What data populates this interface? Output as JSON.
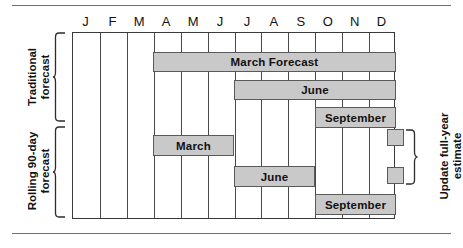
{
  "chart_data": {
    "type": "bar",
    "xlabel": "",
    "ylabel": "",
    "grid": true,
    "legend_position": "none",
    "categories": [
      "J",
      "F",
      "M",
      "A",
      "M",
      "J",
      "J",
      "A",
      "S",
      "O",
      "N",
      "D"
    ],
    "x_axis_months": [
      "J",
      "F",
      "M",
      "A",
      "M",
      "J",
      "J",
      "A",
      "S",
      "O",
      "N",
      "D"
    ],
    "xlim": [
      1,
      13
    ],
    "groups": [
      {
        "name": "Traditional forecast",
        "bars": [
          {
            "label": "March Forecast",
            "start_month": 4,
            "end_month": 13,
            "row": 0
          },
          {
            "label": "June",
            "start_month": 7,
            "end_month": 13,
            "row": 1
          },
          {
            "label": "September",
            "start_month": 10,
            "end_month": 13,
            "row": 2
          }
        ]
      },
      {
        "name": "Rolling 90-day forecast",
        "bars": [
          {
            "label": "March",
            "start_month": 4,
            "end_month": 7,
            "row": 3
          },
          {
            "label": "June",
            "start_month": 7,
            "end_month": 10,
            "row": 4
          },
          {
            "label": "September",
            "start_month": 10,
            "end_month": 13,
            "row": 5
          }
        ]
      }
    ],
    "annotations": [
      {
        "label": "Update full-year estimate",
        "markers": 2,
        "at_month": 12.6
      }
    ]
  },
  "months": [
    {
      "label": "J"
    },
    {
      "label": "F"
    },
    {
      "label": "M"
    },
    {
      "label": "A"
    },
    {
      "label": "M"
    },
    {
      "label": "J"
    },
    {
      "label": "J"
    },
    {
      "label": "A"
    },
    {
      "label": "S"
    },
    {
      "label": "O"
    },
    {
      "label": "N"
    },
    {
      "label": "D"
    }
  ],
  "bars": [
    {
      "label": "March Forecast",
      "left": 80,
      "top": 19,
      "width": 243,
      "height": 20
    },
    {
      "label": "June",
      "left": 161,
      "top": 47,
      "width": 162,
      "height": 20
    },
    {
      "label": "September",
      "left": 242,
      "top": 74,
      "width": 81,
      "height": 21
    },
    {
      "label": "March",
      "left": 80,
      "top": 102,
      "width": 81,
      "height": 21
    },
    {
      "label": "June",
      "left": 161,
      "top": 133,
      "width": 81,
      "height": 21
    },
    {
      "label": "September",
      "left": 242,
      "top": 161,
      "width": 81,
      "height": 21
    }
  ],
  "side_labels": {
    "traditional": "Traditional\nforecast",
    "traditional_line1": "Traditional",
    "traditional_line2": "forecast",
    "rolling_line1": "Rolling 90-day",
    "rolling_line2": "forecast"
  },
  "right_label": {
    "line1": "Update full-year",
    "line2": "estimate"
  },
  "colors": {
    "bar_fill": "#c9c9c9",
    "bar_stroke": "#5a5a5a",
    "grid_stroke": "#4a4a4a",
    "frame_stroke": "#3a3a3a",
    "rule": "#6f6f6f",
    "text": "#111111",
    "background": "#ffffff"
  }
}
